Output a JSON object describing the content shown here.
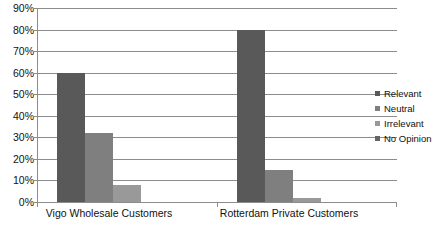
{
  "chart_data": {
    "type": "bar",
    "title": "",
    "subtitle": "",
    "xlabel": "",
    "ylabel": "",
    "ylim": [
      0,
      90
    ],
    "ytick_labels": [
      "0%",
      "10%",
      "20%",
      "30%",
      "40%",
      "50%",
      "60%",
      "70%",
      "80%",
      "90%"
    ],
    "ytick_values": [
      0,
      10,
      20,
      30,
      40,
      50,
      60,
      70,
      80,
      90
    ],
    "grid": true,
    "grid_axis": "y",
    "legend_position": "right",
    "categories": [
      "Vigo Wholesale Customers",
      "Rotterdam Private Customers"
    ],
    "series": [
      {
        "name": "Relevant",
        "values": [
          60,
          80
        ],
        "color": "#595959"
      },
      {
        "name": "Neutral",
        "values": [
          32,
          15
        ],
        "color": "#7f7f7f"
      },
      {
        "name": "Irrelevant",
        "values": [
          8,
          2
        ],
        "color": "#999999"
      },
      {
        "name": "No Opinion",
        "values": [
          0,
          0
        ],
        "color": "#666666"
      }
    ]
  },
  "legend": {
    "items": [
      {
        "label": "Relevant"
      },
      {
        "label": "Neutral"
      },
      {
        "label": "Irrelevant"
      },
      {
        "label": "No Opinion"
      }
    ]
  },
  "colors": {
    "axis": "#8c8c8c",
    "grid": "#8c8c8c",
    "text": "#111111",
    "background": "#ffffff"
  }
}
